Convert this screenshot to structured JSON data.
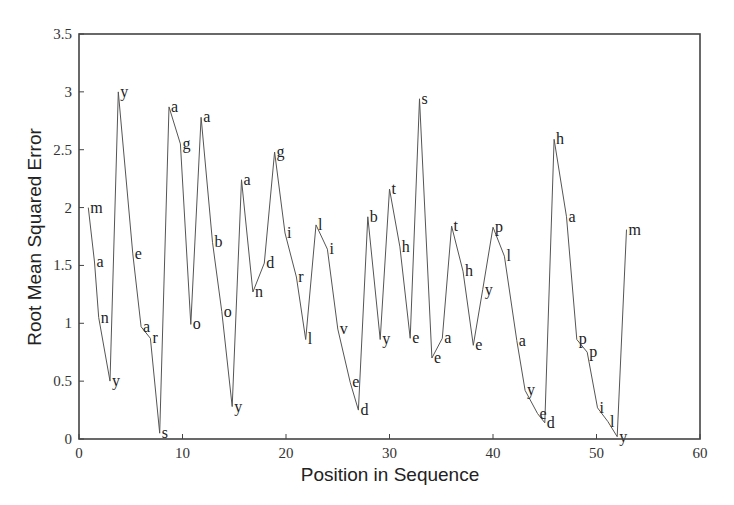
{
  "chart_data": {
    "type": "line",
    "title": "",
    "xlabel": "Position in Sequence",
    "ylabel": "Root Mean Squared Error",
    "xlim": [
      0,
      60
    ],
    "ylim": [
      0,
      3.5
    ],
    "xticks": [
      0,
      10,
      20,
      30,
      40,
      50,
      60
    ],
    "yticks": [
      0,
      0.5,
      1,
      1.5,
      2,
      2.5,
      3,
      3.5
    ],
    "ytick_labels": [
      "0",
      "0.5",
      "1",
      "1.5",
      "2",
      "2.5",
      "3",
      "3.5"
    ],
    "grid": false,
    "legend": null,
    "annotation_text": "manyyearsagoaboyandgirllivedbytheseatheyplayedhappilym",
    "points": [
      {
        "x": 0.9,
        "y": 2.0,
        "label": "m"
      },
      {
        "x": 1.5,
        "y": 1.53,
        "label": "a"
      },
      {
        "x": 1.9,
        "y": 1.05,
        "label": "n"
      },
      {
        "x": 3.0,
        "y": 0.5,
        "label": "y"
      },
      {
        "x": 3.8,
        "y": 3.0,
        "label": "y"
      },
      {
        "x": 5.2,
        "y": 1.6,
        "label": "e"
      },
      {
        "x": 6.0,
        "y": 0.97,
        "label": "a"
      },
      {
        "x": 6.9,
        "y": 0.87,
        "label": "r"
      },
      {
        "x": 7.8,
        "y": 0.05,
        "label": "s"
      },
      {
        "x": 8.7,
        "y": 2.87,
        "label": "a"
      },
      {
        "x": 9.8,
        "y": 2.55,
        "label": "g"
      },
      {
        "x": 10.8,
        "y": 0.99,
        "label": "o"
      },
      {
        "x": 11.8,
        "y": 2.78,
        "label": "a"
      },
      {
        "x": 12.9,
        "y": 1.7,
        "label": "b"
      },
      {
        "x": 13.8,
        "y": 1.1,
        "label": "o"
      },
      {
        "x": 14.8,
        "y": 0.28,
        "label": "y"
      },
      {
        "x": 15.7,
        "y": 2.24,
        "label": "a"
      },
      {
        "x": 16.8,
        "y": 1.27,
        "label": "n"
      },
      {
        "x": 17.9,
        "y": 1.52,
        "label": "d"
      },
      {
        "x": 18.9,
        "y": 2.48,
        "label": "g"
      },
      {
        "x": 19.9,
        "y": 1.78,
        "label": "i"
      },
      {
        "x": 21.0,
        "y": 1.4,
        "label": "r"
      },
      {
        "x": 21.9,
        "y": 0.86,
        "label": "l"
      },
      {
        "x": 22.9,
        "y": 1.85,
        "label": "l"
      },
      {
        "x": 24.0,
        "y": 1.64,
        "label": "i"
      },
      {
        "x": 25.0,
        "y": 0.95,
        "label": "v"
      },
      {
        "x": 26.2,
        "y": 0.49,
        "label": "e"
      },
      {
        "x": 27.0,
        "y": 0.25,
        "label": "d"
      },
      {
        "x": 27.9,
        "y": 1.92,
        "label": "b"
      },
      {
        "x": 29.1,
        "y": 0.86,
        "label": "y"
      },
      {
        "x": 30.0,
        "y": 2.16,
        "label": "t"
      },
      {
        "x": 31.0,
        "y": 1.66,
        "label": "h"
      },
      {
        "x": 32.0,
        "y": 0.87,
        "label": "e"
      },
      {
        "x": 32.9,
        "y": 2.94,
        "label": "s"
      },
      {
        "x": 34.1,
        "y": 0.7,
        "label": "e"
      },
      {
        "x": 35.1,
        "y": 0.87,
        "label": "a"
      },
      {
        "x": 36.0,
        "y": 1.84,
        "label": "t"
      },
      {
        "x": 37.1,
        "y": 1.45,
        "label": "h"
      },
      {
        "x": 38.1,
        "y": 0.81,
        "label": "e"
      },
      {
        "x": 39.0,
        "y": 1.29,
        "label": "y"
      },
      {
        "x": 40.0,
        "y": 1.83,
        "label": "p"
      },
      {
        "x": 41.1,
        "y": 1.58,
        "label": "l"
      },
      {
        "x": 42.3,
        "y": 0.85,
        "label": "a"
      },
      {
        "x": 43.1,
        "y": 0.42,
        "label": "y"
      },
      {
        "x": 44.3,
        "y": 0.22,
        "label": "e"
      },
      {
        "x": 45.0,
        "y": 0.14,
        "label": "d"
      },
      {
        "x": 45.9,
        "y": 2.59,
        "label": "h"
      },
      {
        "x": 47.1,
        "y": 1.92,
        "label": "a"
      },
      {
        "x": 48.1,
        "y": 0.86,
        "label": "p"
      },
      {
        "x": 49.1,
        "y": 0.75,
        "label": "p"
      },
      {
        "x": 50.1,
        "y": 0.27,
        "label": "i"
      },
      {
        "x": 51.1,
        "y": 0.15,
        "label": "l"
      },
      {
        "x": 52.0,
        "y": 0.02,
        "label": "y"
      },
      {
        "x": 52.9,
        "y": 1.81,
        "label": "m"
      }
    ]
  },
  "colors": {
    "line": "#555555",
    "axis": "#444444",
    "text": "#222222",
    "background": "#ffffff"
  }
}
